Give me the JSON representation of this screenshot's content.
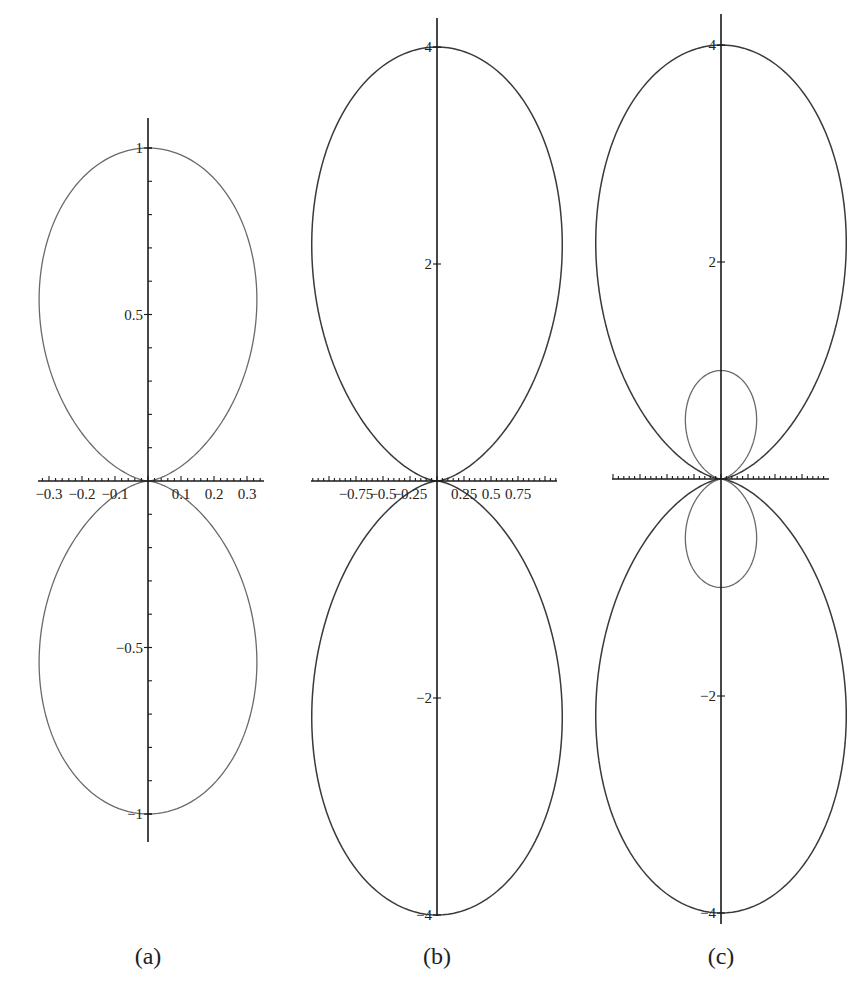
{
  "chart_data": [
    {
      "panel": "a",
      "type": "line",
      "subtype": "polar-curve",
      "caption": "(a)",
      "title": "",
      "xlabel": "",
      "ylabel": "",
      "xlim": [
        -0.33,
        0.36
      ],
      "ylim": [
        -1.1,
        1.1
      ],
      "grid": false,
      "x_ticks": [
        -0.3,
        -0.2,
        -0.1,
        0.1,
        0.2,
        0.3
      ],
      "x_tick_labels": [
        "−0.3",
        "−0.2",
        "−0.1",
        "0.1",
        "0.2",
        "0.3"
      ],
      "y_ticks": [
        1,
        0.5,
        -0.5,
        -1
      ],
      "y_tick_labels": [
        "1",
        "0.5",
        "−0.5",
        "−1"
      ],
      "series": [
        {
          "name": "outer lobes",
          "amplitude": 1.0,
          "description": "two symmetric vertical lobes, y in [-1,1], max |x| ≈ 0.33"
        }
      ]
    },
    {
      "panel": "b",
      "type": "line",
      "subtype": "polar-curve",
      "caption": "(b)",
      "title": "",
      "xlabel": "",
      "ylabel": "",
      "xlim": [
        -1.15,
        0.95
      ],
      "ylim": [
        -4.1,
        4.1
      ],
      "grid": false,
      "x_ticks": [
        -0.75,
        -0.5,
        -0.25,
        0.25,
        0.5,
        0.75
      ],
      "x_tick_labels": [
        "−0.75",
        "−0.5",
        "−0.25",
        "0.25",
        "0.5",
        "0.75"
      ],
      "y_ticks": [
        4,
        2,
        -2,
        -4
      ],
      "y_tick_labels": [
        "4",
        "2",
        "−2",
        "−4"
      ],
      "series": [
        {
          "name": "outer lobes",
          "amplitude": 4.0,
          "description": "two elongated vertical lobes, y in [-4,4], max |x| ≈ 1.15"
        }
      ]
    },
    {
      "panel": "c",
      "type": "line",
      "subtype": "polar-curve",
      "caption": "(c)",
      "title": "",
      "xlabel": "",
      "ylabel": "",
      "xlim": [
        -1.1,
        1.0
      ],
      "ylim": [
        -4.1,
        4.1
      ],
      "grid": false,
      "x_ticks": [],
      "x_tick_labels": [],
      "y_ticks": [
        4,
        2,
        -2,
        -4
      ],
      "y_tick_labels": [
        "4",
        "2",
        "−2",
        "−4"
      ],
      "series": [
        {
          "name": "outer lobes",
          "amplitude": 4.0,
          "description": "same as (b), y in [-4,4]"
        },
        {
          "name": "inner loops",
          "amplitude": 1.0,
          "description": "small loops, y in [-1,1], max |x| ≈ 0.33"
        }
      ]
    }
  ],
  "captions": {
    "a": "(a)",
    "b": "(b)",
    "c": "(c)"
  }
}
